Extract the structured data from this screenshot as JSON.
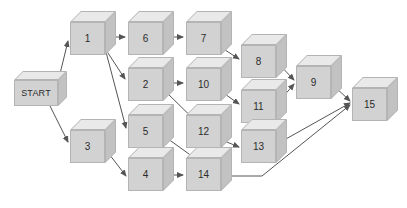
{
  "diagram": {
    "background_color": "#ffffff",
    "node_style": {
      "shape": "cube",
      "front_color": "#d2d2d2",
      "top_color": "#e9e9e9",
      "side_color": "#c2c2c2",
      "border_color": "#b4b4b4",
      "label_color": "#2b2b2b"
    },
    "edge_style": {
      "color": "#555555",
      "width": 1,
      "arrowhead": "filled-triangle"
    },
    "nodes": [
      {
        "id": "start",
        "label": "START",
        "x": 14,
        "y": 80,
        "w": 44,
        "h": 26,
        "depth": 9
      },
      {
        "id": "n1",
        "label": "1",
        "x": 70,
        "y": 22,
        "w": 35,
        "h": 33,
        "depth": 11
      },
      {
        "id": "n6",
        "label": "6",
        "x": 128,
        "y": 22,
        "w": 35,
        "h": 33,
        "depth": 11
      },
      {
        "id": "n7",
        "label": "7",
        "x": 186,
        "y": 22,
        "w": 35,
        "h": 33,
        "depth": 11
      },
      {
        "id": "n2",
        "label": "2",
        "x": 128,
        "y": 68,
        "w": 35,
        "h": 33,
        "depth": 11
      },
      {
        "id": "n10",
        "label": "10",
        "x": 186,
        "y": 68,
        "w": 35,
        "h": 33,
        "depth": 11
      },
      {
        "id": "n8",
        "label": "8",
        "x": 241,
        "y": 45,
        "w": 35,
        "h": 33,
        "depth": 11
      },
      {
        "id": "n11",
        "label": "11",
        "x": 241,
        "y": 90,
        "w": 35,
        "h": 33,
        "depth": 11
      },
      {
        "id": "n9",
        "label": "9",
        "x": 296,
        "y": 66,
        "w": 35,
        "h": 33,
        "depth": 11
      },
      {
        "id": "n15",
        "label": "15",
        "x": 352,
        "y": 88,
        "w": 35,
        "h": 33,
        "depth": 11
      },
      {
        "id": "n5",
        "label": "5",
        "x": 128,
        "y": 115,
        "w": 35,
        "h": 33,
        "depth": 11
      },
      {
        "id": "n12",
        "label": "12",
        "x": 186,
        "y": 115,
        "w": 35,
        "h": 33,
        "depth": 11
      },
      {
        "id": "n13",
        "label": "13",
        "x": 241,
        "y": 130,
        "w": 35,
        "h": 33,
        "depth": 11
      },
      {
        "id": "n3",
        "label": "3",
        "x": 70,
        "y": 130,
        "w": 35,
        "h": 33,
        "depth": 11
      },
      {
        "id": "n4",
        "label": "4",
        "x": 128,
        "y": 158,
        "w": 35,
        "h": 33,
        "depth": 11
      },
      {
        "id": "n14",
        "label": "14",
        "x": 186,
        "y": 158,
        "w": 35,
        "h": 33,
        "depth": 11
      }
    ],
    "edges": [
      {
        "from": "start",
        "to": "n1",
        "points": "58,82 68,41"
      },
      {
        "from": "start",
        "to": "n3",
        "points": "50,106 68,142"
      },
      {
        "from": "n1",
        "to": "n6",
        "points": "107,37 125,37"
      },
      {
        "from": "n6",
        "to": "n7",
        "points": "165,37 183,37"
      },
      {
        "from": "n1",
        "to": "n2",
        "points": "106,50 125,79"
      },
      {
        "from": "n1",
        "to": "n5",
        "points": "106,52 126,128"
      },
      {
        "from": "n2",
        "to": "n10",
        "points": "165,83 183,83"
      },
      {
        "from": "n2",
        "to": "n12",
        "points": "164,90 215,140"
      },
      {
        "from": "n7",
        "to": "n8",
        "points": "222,48 239,59"
      },
      {
        "from": "n10",
        "to": "n11",
        "points": "222,92 239,104"
      },
      {
        "from": "n12",
        "to": "n13",
        "points": "222,140 239,147"
      },
      {
        "from": "n8",
        "to": "n9",
        "points": "277,62 294,80"
      },
      {
        "from": "n11",
        "to": "n9",
        "points": "277,104 294,84"
      },
      {
        "from": "n5",
        "to": "n14",
        "points": "164,136 214,172"
      },
      {
        "from": "n3",
        "to": "n4",
        "points": "106,150 126,176"
      },
      {
        "from": "n4",
        "to": "n14",
        "points": "165,175 183,175"
      },
      {
        "from": "n9",
        "to": "n15",
        "points": "332,84 350,101"
      },
      {
        "from": "n13",
        "to": "n15",
        "points": "277,144 350,103"
      },
      {
        "from": "n14",
        "to": "n15",
        "points": "222,176 262,176 350,105"
      }
    ]
  }
}
